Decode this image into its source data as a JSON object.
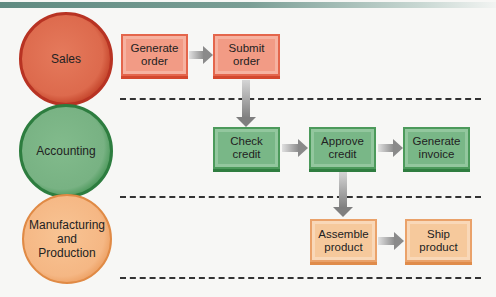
{
  "lanes": [
    {
      "id": "sales",
      "label": "Sales",
      "color": "#dd6a4d"
    },
    {
      "id": "accounting",
      "label": "Accounting",
      "color": "#78b283"
    },
    {
      "id": "manufacturing",
      "label": "Manufacturing\nand\nProduction",
      "color": "#f5b784"
    }
  ],
  "steps": {
    "generate_order": "Generate order",
    "submit_order": "Submit order",
    "check_credit": "Check credit",
    "approve_credit": "Approve credit",
    "generate_invoice": "Generate invoice",
    "assemble_product": "Assemble product",
    "ship_product": "Ship product"
  },
  "flow": [
    [
      "Generate order",
      "Submit order"
    ],
    [
      "Submit order",
      "Check credit"
    ],
    [
      "Check credit",
      "Approve credit"
    ],
    [
      "Approve credit",
      "Generate invoice"
    ],
    [
      "Approve credit",
      "Assemble product"
    ],
    [
      "Assemble product",
      "Ship product"
    ]
  ]
}
